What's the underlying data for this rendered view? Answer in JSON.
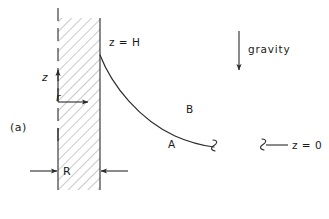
{
  "figure": {
    "panel_label": "(a)",
    "labels": {
      "surface_height": "z = H",
      "axis_z": "z",
      "axis_r": "r",
      "radius": "R",
      "region_a": "A",
      "region_b": "B",
      "gravity": "gravity",
      "datum": "z = 0"
    },
    "colors": {
      "ink": "#2b2b2b",
      "hatch": "#8a8a8a",
      "background": "#ffffff"
    }
  }
}
